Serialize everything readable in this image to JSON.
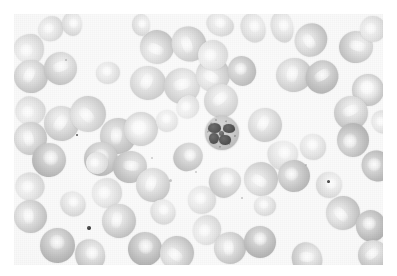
{
  "image": {
    "kind": "light-microscopy-micrograph",
    "subject": "peripheral blood smear",
    "modality": "brightfield",
    "color_mode": "grayscale",
    "width": 397,
    "height": 276,
    "background_color": "#ffffff",
    "field_color": "#fafafa",
    "margin": {
      "left": 14,
      "top": 14,
      "right": 14,
      "bottom": 11
    },
    "alt_text": "Grayscale micrograph of a peripheral blood smear showing numerous red blood cells with pale centers and one segmented neutrophil with a dark multi-lobed nucleus near the center."
  },
  "palette": {
    "background": "#ffffff",
    "field": "#fafafa",
    "rbc_rim": "#c3c3c3",
    "rbc_center": "#efefef",
    "rbc_dark_rim": "#b0b0b0",
    "wbc_cytoplasm": "#b9b9b9",
    "wbc_nucleus": "#1a1a1a",
    "platelet": "#303030"
  },
  "features": {
    "white_blood_cell": {
      "label": "segmented neutrophil",
      "cx": 222,
      "cy": 133,
      "diameter": 34,
      "nucleus_lobes": 4
    },
    "platelet_count": 3,
    "red_blood_cell_count": 78
  },
  "red_blood_cells": [
    {
      "x": 14,
      "y": 34,
      "w": 30,
      "h": 30,
      "style": "pale tear"
    },
    {
      "x": 38,
      "y": 17,
      "w": 26,
      "h": 24,
      "style": "pale oval"
    },
    {
      "x": 14,
      "y": 60,
      "w": 34,
      "h": 33,
      "style": "streak"
    },
    {
      "x": 44,
      "y": 52,
      "w": 33,
      "h": 33,
      "style": "streak"
    },
    {
      "x": 16,
      "y": 96,
      "w": 29,
      "h": 30,
      "style": "pale blob"
    },
    {
      "x": 14,
      "y": 122,
      "w": 33,
      "h": 33,
      "style": "streak"
    },
    {
      "x": 44,
      "y": 106,
      "w": 35,
      "h": 35,
      "style": "streak"
    },
    {
      "x": 32,
      "y": 143,
      "w": 34,
      "h": 34,
      "style": "dark"
    },
    {
      "x": 16,
      "y": 172,
      "w": 28,
      "h": 29,
      "style": "pale"
    },
    {
      "x": 14,
      "y": 200,
      "w": 33,
      "h": 33,
      "style": "streak"
    },
    {
      "x": 40,
      "y": 228,
      "w": 35,
      "h": 35,
      "style": "dark"
    },
    {
      "x": 74,
      "y": 240,
      "w": 32,
      "h": 30,
      "style": "blob"
    },
    {
      "x": 70,
      "y": 96,
      "w": 36,
      "h": 36,
      "style": "streak"
    },
    {
      "x": 100,
      "y": 118,
      "w": 36,
      "h": 36,
      "style": "dark streak"
    },
    {
      "x": 84,
      "y": 142,
      "w": 34,
      "h": 34,
      "style": "dark"
    },
    {
      "x": 114,
      "y": 150,
      "w": 32,
      "h": 34,
      "style": "dark streak"
    },
    {
      "x": 92,
      "y": 178,
      "w": 30,
      "h": 30,
      "style": "pale"
    },
    {
      "x": 102,
      "y": 204,
      "w": 34,
      "h": 34,
      "style": "streak"
    },
    {
      "x": 128,
      "y": 232,
      "w": 34,
      "h": 34,
      "style": "dark"
    },
    {
      "x": 60,
      "y": 14,
      "w": 24,
      "h": 20,
      "style": "pale oval"
    },
    {
      "x": 86,
      "y": 152,
      "w": 22,
      "h": 22,
      "style": "pale"
    },
    {
      "x": 136,
      "y": 168,
      "w": 34,
      "h": 34,
      "style": "streak"
    },
    {
      "x": 150,
      "y": 200,
      "w": 26,
      "h": 24,
      "style": "pale"
    },
    {
      "x": 140,
      "y": 30,
      "w": 34,
      "h": 34,
      "style": "streak"
    },
    {
      "x": 172,
      "y": 26,
      "w": 34,
      "h": 36,
      "style": "streak"
    },
    {
      "x": 130,
      "y": 66,
      "w": 36,
      "h": 34,
      "style": "streak"
    },
    {
      "x": 164,
      "y": 68,
      "w": 36,
      "h": 36,
      "style": "streak"
    },
    {
      "x": 196,
      "y": 58,
      "w": 34,
      "h": 34,
      "style": "streak"
    },
    {
      "x": 124,
      "y": 112,
      "w": 34,
      "h": 34,
      "style": "donut"
    },
    {
      "x": 156,
      "y": 110,
      "w": 22,
      "h": 22,
      "style": "pale"
    },
    {
      "x": 174,
      "y": 142,
      "w": 28,
      "h": 30,
      "style": "dark"
    },
    {
      "x": 160,
      "y": 236,
      "w": 34,
      "h": 34,
      "style": "streak"
    },
    {
      "x": 188,
      "y": 186,
      "w": 28,
      "h": 28,
      "style": "pale"
    },
    {
      "x": 206,
      "y": 14,
      "w": 28,
      "h": 22,
      "style": "pale oval"
    },
    {
      "x": 238,
      "y": 16,
      "w": 30,
      "h": 24,
      "style": "pale oval"
    },
    {
      "x": 198,
      "y": 40,
      "w": 30,
      "h": 30,
      "style": "pale"
    },
    {
      "x": 228,
      "y": 56,
      "w": 28,
      "h": 30,
      "style": "dark"
    },
    {
      "x": 204,
      "y": 84,
      "w": 34,
      "h": 34,
      "style": "streak"
    },
    {
      "x": 266,
      "y": 16,
      "w": 32,
      "h": 22,
      "style": "pale oval"
    },
    {
      "x": 294,
      "y": 24,
      "w": 34,
      "h": 32,
      "style": "streak"
    },
    {
      "x": 276,
      "y": 58,
      "w": 36,
      "h": 34,
      "style": "streak"
    },
    {
      "x": 306,
      "y": 60,
      "w": 32,
      "h": 34,
      "style": "dark streak"
    },
    {
      "x": 340,
      "y": 30,
      "w": 32,
      "h": 34,
      "style": "streak"
    },
    {
      "x": 360,
      "y": 16,
      "w": 26,
      "h": 26,
      "style": "pale"
    },
    {
      "x": 352,
      "y": 74,
      "w": 32,
      "h": 32,
      "style": "donut"
    },
    {
      "x": 334,
      "y": 96,
      "w": 34,
      "h": 34,
      "style": "streak"
    },
    {
      "x": 336,
      "y": 124,
      "w": 34,
      "h": 32,
      "style": "dark"
    },
    {
      "x": 362,
      "y": 150,
      "w": 30,
      "h": 32,
      "style": "dark"
    },
    {
      "x": 248,
      "y": 108,
      "w": 34,
      "h": 34,
      "style": "streak"
    },
    {
      "x": 268,
      "y": 140,
      "w": 30,
      "h": 30,
      "style": "pale tear"
    },
    {
      "x": 244,
      "y": 162,
      "w": 34,
      "h": 34,
      "style": "streak"
    },
    {
      "x": 278,
      "y": 160,
      "w": 32,
      "h": 32,
      "style": "dark"
    },
    {
      "x": 300,
      "y": 134,
      "w": 26,
      "h": 26,
      "style": "pale"
    },
    {
      "x": 210,
      "y": 166,
      "w": 30,
      "h": 32,
      "style": "tear"
    },
    {
      "x": 192,
      "y": 216,
      "w": 30,
      "h": 28,
      "style": "pale"
    },
    {
      "x": 214,
      "y": 232,
      "w": 32,
      "h": 32,
      "style": "streak"
    },
    {
      "x": 244,
      "y": 226,
      "w": 32,
      "h": 32,
      "style": "dark"
    },
    {
      "x": 290,
      "y": 244,
      "w": 34,
      "h": 30,
      "style": "streak"
    },
    {
      "x": 326,
      "y": 196,
      "w": 34,
      "h": 34,
      "style": "streak"
    },
    {
      "x": 356,
      "y": 210,
      "w": 30,
      "h": 32,
      "style": "dark"
    },
    {
      "x": 358,
      "y": 240,
      "w": 30,
      "h": 30,
      "style": "streak"
    },
    {
      "x": 316,
      "y": 172,
      "w": 26,
      "h": 26,
      "style": "pale"
    },
    {
      "x": 176,
      "y": 96,
      "w": 24,
      "h": 22,
      "style": "pale oval"
    },
    {
      "x": 96,
      "y": 62,
      "w": 24,
      "h": 22,
      "style": "pale"
    },
    {
      "x": 60,
      "y": 192,
      "w": 26,
      "h": 24,
      "style": "pale"
    },
    {
      "x": 130,
      "y": 16,
      "w": 22,
      "h": 18,
      "style": "pale oval"
    },
    {
      "x": 372,
      "y": 110,
      "w": 22,
      "h": 24,
      "style": "pale"
    },
    {
      "x": 254,
      "y": 196,
      "w": 22,
      "h": 20,
      "style": "pale"
    }
  ],
  "platelets": [
    {
      "x": 89,
      "y": 228,
      "d": 4
    },
    {
      "x": 77,
      "y": 135,
      "d": 2
    },
    {
      "x": 328,
      "y": 181,
      "d": 3
    }
  ],
  "debris": [
    {
      "x": 170,
      "y": 180,
      "d": 3
    },
    {
      "x": 196,
      "y": 172,
      "d": 2
    },
    {
      "x": 242,
      "y": 198,
      "d": 2
    },
    {
      "x": 306,
      "y": 165,
      "d": 2
    },
    {
      "x": 152,
      "y": 158,
      "d": 2
    },
    {
      "x": 66,
      "y": 60,
      "d": 2
    }
  ]
}
